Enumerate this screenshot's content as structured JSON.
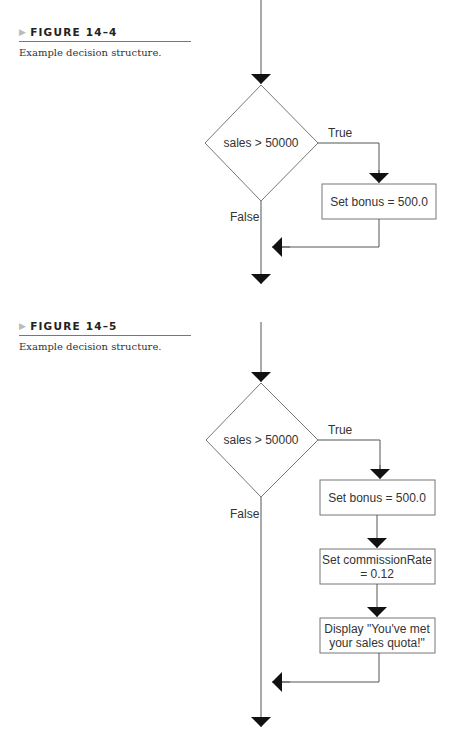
{
  "figures": [
    {
      "label": "FIGURE 14–4",
      "caption": "Example decision structure.",
      "decision": "sales > 50000",
      "true_label": "True",
      "false_label": "False",
      "steps": [
        {
          "line1": "Set bonus = 500.0"
        }
      ]
    },
    {
      "label": "FIGURE 14–5",
      "caption": "Example decision structure.",
      "decision": "sales > 50000",
      "true_label": "True",
      "false_label": "False",
      "steps": [
        {
          "line1": "Set bonus = 500.0"
        },
        {
          "line1": "Set commissionRate",
          "line2": "= 0.12"
        },
        {
          "line1": "Display \"You've met",
          "line2": "your sales quota!\""
        }
      ]
    }
  ]
}
